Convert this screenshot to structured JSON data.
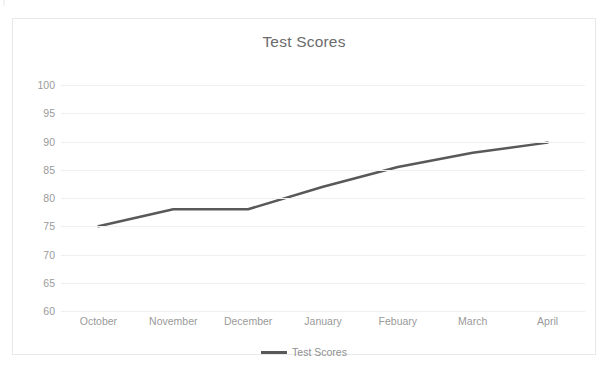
{
  "chart_data": {
    "type": "line",
    "title": "Test Scores",
    "xlabel": "",
    "ylabel": "",
    "categories": [
      "October",
      "November",
      "December",
      "January",
      "Febuary",
      "March",
      "April"
    ],
    "series": [
      {
        "name": "Test Scores",
        "values": [
          75,
          78,
          78,
          82,
          85.5,
          88,
          89.8
        ]
      }
    ],
    "ylim": [
      60,
      100
    ],
    "y_ticks": [
      100,
      95,
      90,
      85,
      80,
      75,
      70,
      65,
      60
    ],
    "y_tick_labels": [
      "100",
      "95",
      "90",
      "85",
      "80",
      "75",
      "70",
      "65",
      "60"
    ],
    "grid": true,
    "legend_position": "bottom",
    "line_color": "#595959",
    "gridline_color": "#efefef",
    "text_color": "#9a9a9a",
    "title_color": "#6b6b6b",
    "border_color": "#e8e8e8",
    "background_color": "#ffffff"
  },
  "legend": {
    "entries": [
      {
        "label": "Test Scores",
        "swatch_name": "line-swatch"
      }
    ]
  }
}
